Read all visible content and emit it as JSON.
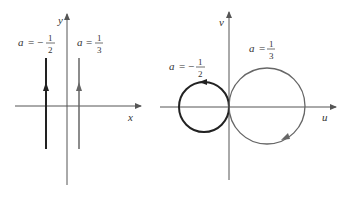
{
  "left_plot": {
    "x_axis_label": "x",
    "y_axis_label": "y",
    "lines": [
      {
        "label_var": "a",
        "label_eq": "=",
        "sign": "−",
        "numerator": "1",
        "denominator": "2",
        "value": -0.5
      },
      {
        "label_var": "a",
        "label_eq": "=",
        "sign": "",
        "numerator": "1",
        "denominator": "3",
        "value": 0.3333
      }
    ]
  },
  "right_plot": {
    "x_axis_label": "u",
    "y_axis_label": "v",
    "circles": [
      {
        "label_var": "a",
        "label_eq": "=",
        "sign": "−",
        "numerator": "1",
        "denominator": "2",
        "value": -0.5,
        "direction": "counterclockwise"
      },
      {
        "label_var": "a",
        "label_eq": "=",
        "sign": "",
        "numerator": "1",
        "denominator": "3",
        "value": 0.3333,
        "direction": "clockwise"
      }
    ]
  },
  "colors": {
    "dark": "#222222",
    "gray": "#666666",
    "axis": "#555555"
  }
}
